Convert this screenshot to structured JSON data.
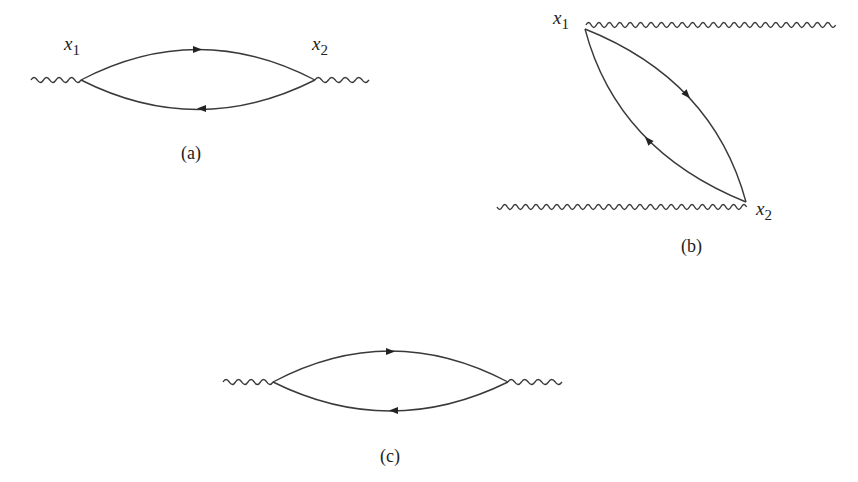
{
  "figure": {
    "panels": [
      {
        "id": "a",
        "caption": "(a)",
        "vertex_labels": [
          {
            "var": "x",
            "sub": "1"
          },
          {
            "var": "x",
            "sub": "2"
          }
        ],
        "description": "Fermion loop between two photon vertices, external wavy lines on left and right"
      },
      {
        "id": "b",
        "caption": "(b)",
        "vertex_labels": [
          {
            "var": "x",
            "sub": "1"
          },
          {
            "var": "x",
            "sub": "2"
          }
        ],
        "description": "Same loop drawn diagonally, external wavy lines extending right from x1 and left from x2"
      },
      {
        "id": "c",
        "caption": "(c)",
        "vertex_labels": [],
        "description": "Unlabeled fermion loop with two external wavy lines"
      }
    ],
    "colors": {
      "line": "#3a3a3a",
      "text": "#222222",
      "background": "#ffffff"
    }
  }
}
